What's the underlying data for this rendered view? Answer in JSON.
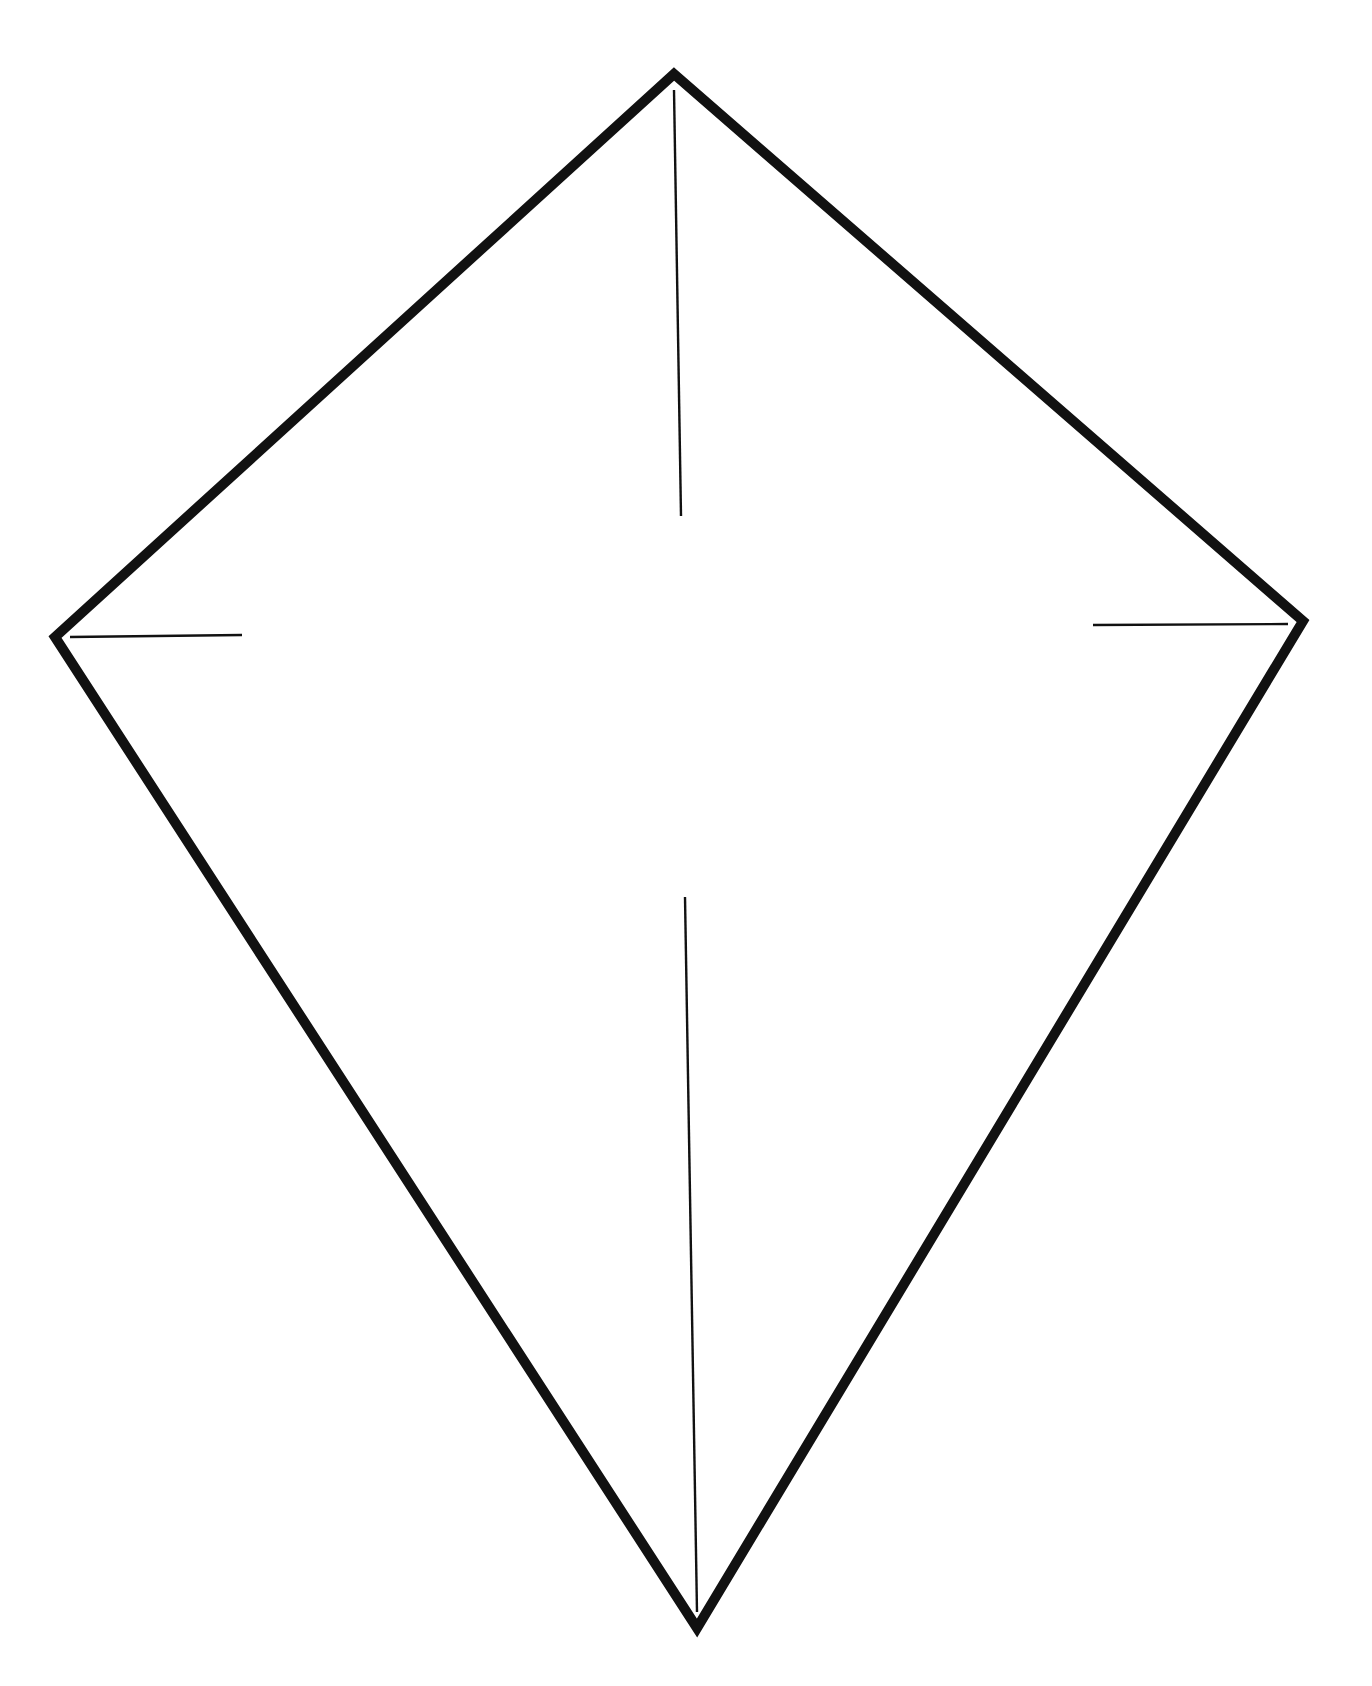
{
  "diagram": {
    "type": "kite-outline",
    "background": "#ffffff",
    "stroke_color": "#111111",
    "outline": {
      "stroke_width": 10,
      "vertices": {
        "top": [
          674,
          74
        ],
        "right": [
          1303,
          621
        ],
        "bottom": [
          697,
          1628
        ],
        "left": [
          55,
          637
        ]
      }
    },
    "guide_lines": {
      "stroke_width": 2.4,
      "top_spar": {
        "x1": 674,
        "y1": 90,
        "x2": 681,
        "y2": 516
      },
      "bottom_spar": {
        "x1": 685,
        "y1": 897,
        "x2": 697,
        "y2": 1612
      },
      "left_tick": {
        "x1": 70,
        "y1": 637,
        "x2": 242,
        "y2": 635
      },
      "right_tick": {
        "x1": 1093,
        "y1": 625,
        "x2": 1288,
        "y2": 624
      }
    }
  }
}
